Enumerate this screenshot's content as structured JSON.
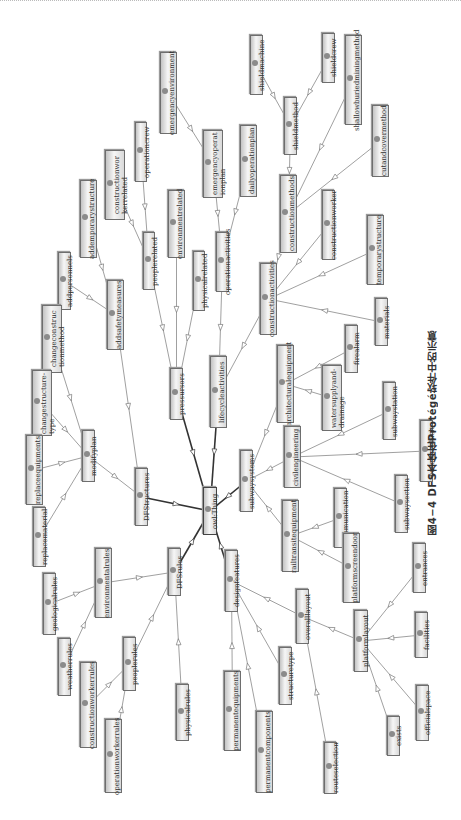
{
  "diagram": {
    "root": "owl:Thing",
    "orientation": "rotated-90",
    "node_style": {
      "fill": "#ececec",
      "border": "#6e6e6e",
      "dot": "#8b8b8b",
      "edge": "#777777",
      "edge_root": "#333333"
    },
    "nodes": [
      {
        "id": "thing",
        "label": "owl:Thing",
        "x": 203,
        "y": 487,
        "w": 14,
        "h": 48
      },
      {
        "id": "dfstructures",
        "label": "DFStructures",
        "x": 135,
        "y": 468,
        "w": 13,
        "h": 58
      },
      {
        "id": "dfsrules",
        "label": "DFSrules",
        "x": 168,
        "y": 548,
        "w": 13,
        "h": 48
      },
      {
        "id": "pressursors",
        "label": "pressursors",
        "x": 170,
        "y": 368,
        "w": 13,
        "h": 52
      },
      {
        "id": "lifecycleactivities",
        "label": "lifecycleactivities",
        "x": 210,
        "y": 356,
        "w": 17,
        "h": 72
      },
      {
        "id": "subwaysystems",
        "label": "subwaysystems",
        "x": 240,
        "y": 450,
        "w": 13,
        "h": 62
      },
      {
        "id": "designfeatures",
        "label": "designfeatures",
        "x": 225,
        "y": 550,
        "w": 13,
        "h": 62
      },
      {
        "id": "modifyplan",
        "label": "modifyplan",
        "x": 82,
        "y": 430,
        "w": 13,
        "h": 52
      },
      {
        "id": "addsafetymeasures",
        "label": "addsafetymeasures",
        "x": 107,
        "y": 280,
        "w": 17,
        "h": 70
      },
      {
        "id": "peoplerelated",
        "label": "peoplerelated",
        "x": 143,
        "y": 232,
        "w": 12,
        "h": 58
      },
      {
        "id": "environmentrelated",
        "label": "environmentrelated",
        "x": 168,
        "y": 190,
        "w": 17,
        "h": 68
      },
      {
        "id": "physicalrelated",
        "label": "physicalrelated",
        "x": 193,
        "y": 251,
        "w": 12,
        "h": 60
      },
      {
        "id": "operationactivities",
        "label": "operationactivities",
        "x": 216,
        "y": 232,
        "w": 13,
        "h": 60
      },
      {
        "id": "constructionactivities",
        "label": "constructionactivities",
        "x": 260,
        "y": 263,
        "w": 17,
        "h": 72
      },
      {
        "id": "architecturalequipment",
        "label": "architecturalequipment",
        "x": 277,
        "y": 345,
        "w": 17,
        "h": 78
      },
      {
        "id": "civilengineering",
        "label": "civilengineering",
        "x": 284,
        "y": 426,
        "w": 17,
        "h": 62
      },
      {
        "id": "railtransitequipment",
        "label": "railtransitequipment",
        "x": 282,
        "y": 500,
        "w": 17,
        "h": 72
      },
      {
        "id": "addemporarystructure",
        "label": "addemporarystructure",
        "x": 80,
        "y": 180,
        "w": 17,
        "h": 78
      },
      {
        "id": "constructionworkerrelated",
        "label": "constructionwor\nkerrelated",
        "x": 105,
        "y": 150,
        "w": 20,
        "h": 70
      },
      {
        "id": "operationcrew",
        "label": "operationcrew",
        "x": 135,
        "y": 122,
        "w": 12,
        "h": 60
      },
      {
        "id": "emergencyenvironment",
        "label": "emergencyenvironment",
        "x": 160,
        "y": 52,
        "w": 17,
        "h": 82
      },
      {
        "id": "emergencyoperationplan",
        "label": "emergencyoperat\nionplan",
        "x": 203,
        "y": 130,
        "w": 20,
        "h": 68
      },
      {
        "id": "dailyoperationplan",
        "label": "dailyoperationplan",
        "x": 240,
        "y": 125,
        "w": 17,
        "h": 72
      },
      {
        "id": "addpersonnels",
        "label": "addpersonnels",
        "x": 58,
        "y": 252,
        "w": 13,
        "h": 58
      },
      {
        "id": "changeconstructionmethod",
        "label": "changeconstruc\ntionmethod",
        "x": 42,
        "y": 305,
        "w": 20,
        "h": 68
      },
      {
        "id": "changestructuretype",
        "label": "changestructure-\ntype",
        "x": 32,
        "y": 370,
        "w": 20,
        "h": 66
      },
      {
        "id": "replaceequipments",
        "label": "replaceequipments",
        "x": 26,
        "y": 435,
        "w": 17,
        "h": 70
      },
      {
        "id": "replacematerial",
        "label": "replacematerial",
        "x": 33,
        "y": 507,
        "w": 13,
        "h": 60
      },
      {
        "id": "constructionmethods",
        "label": "constructionmethods",
        "x": 280,
        "y": 175,
        "w": 17,
        "h": 78
      },
      {
        "id": "constructionworker",
        "label": "constructionworker",
        "x": 322,
        "y": 190,
        "w": 13,
        "h": 70
      },
      {
        "id": "temporarystructure",
        "label": "temporarystructure",
        "x": 367,
        "y": 215,
        "w": 17,
        "h": 70
      },
      {
        "id": "materials",
        "label": "materials",
        "x": 375,
        "y": 298,
        "w": 13,
        "h": 48
      },
      {
        "id": "firealarm",
        "label": "firealarm",
        "x": 345,
        "y": 325,
        "w": 13,
        "h": 48
      },
      {
        "id": "watersupplyanddrainage",
        "label": "watersupplyand-\ndrainage",
        "x": 322,
        "y": 365,
        "w": 20,
        "h": 66
      },
      {
        "id": "subwaystation",
        "label": "subwaystation",
        "x": 383,
        "y": 382,
        "w": 13,
        "h": 58
      },
      {
        "id": "baseforvehicle",
        "label": "baseforvehicle",
        "x": 420,
        "y": 420,
        "w": 13,
        "h": 62
      },
      {
        "id": "subwaysection",
        "label": "subwaysection",
        "x": 395,
        "y": 475,
        "w": 13,
        "h": 58
      },
      {
        "id": "communication",
        "label": "communication",
        "x": 334,
        "y": 488,
        "w": 13,
        "h": 60
      },
      {
        "id": "platformscreendoor",
        "label": "platformscreendoor",
        "x": 343,
        "y": 533,
        "w": 17,
        "h": 70
      },
      {
        "id": "shieldmethod",
        "label": "shieldmethod",
        "x": 284,
        "y": 97,
        "w": 13,
        "h": 58
      },
      {
        "id": "shieldmachine",
        "label": "shieldmachine",
        "x": 250,
        "y": 35,
        "w": 13,
        "h": 60
      },
      {
        "id": "shieldcrew",
        "label": "shieldcrew",
        "x": 322,
        "y": 33,
        "w": 13,
        "h": 50
      },
      {
        "id": "shallowburiedminingmethod",
        "label": "shallowburiedminingmethod",
        "x": 345,
        "y": 35,
        "w": 17,
        "h": 90
      },
      {
        "id": "cutandcovermethod",
        "label": "cutandcovermethod",
        "x": 372,
        "y": 105,
        "w": 17,
        "h": 72
      },
      {
        "id": "environmentalrules",
        "label": "environmentalrules",
        "x": 95,
        "y": 548,
        "w": 17,
        "h": 70
      },
      {
        "id": "geologicalrules",
        "label": "geologicalrules",
        "x": 43,
        "y": 573,
        "w": 13,
        "h": 62
      },
      {
        "id": "weatherrules",
        "label": "weatherrules",
        "x": 58,
        "y": 638,
        "w": 13,
        "h": 58
      },
      {
        "id": "peoplerules",
        "label": "peoplerules",
        "x": 123,
        "y": 637,
        "w": 13,
        "h": 54
      },
      {
        "id": "constructionworkerrules",
        "label": "constructionworkerrules",
        "x": 80,
        "y": 662,
        "w": 17,
        "h": 86
      },
      {
        "id": "operationworkerrules",
        "label": "operationworkerrules",
        "x": 105,
        "y": 719,
        "w": 17,
        "h": 74
      },
      {
        "id": "physicalrules",
        "label": "physicalrules",
        "x": 176,
        "y": 684,
        "w": 13,
        "h": 57
      },
      {
        "id": "permanentequipments",
        "label": "permanentequipments",
        "x": 224,
        "y": 671,
        "w": 17,
        "h": 80
      },
      {
        "id": "permanentcomponents",
        "label": "permanentcomponents",
        "x": 256,
        "y": 711,
        "w": 17,
        "h": 82
      },
      {
        "id": "structuretype",
        "label": "structuretype",
        "x": 279,
        "y": 647,
        "w": 13,
        "h": 58
      },
      {
        "id": "overalllayout",
        "label": "overalllayout",
        "x": 296,
        "y": 589,
        "w": 13,
        "h": 55
      },
      {
        "id": "routeselection",
        "label": "routeselection",
        "x": 324,
        "y": 742,
        "w": 13,
        "h": 52
      },
      {
        "id": "platformlayout",
        "label": "platformlayout",
        "x": 354,
        "y": 610,
        "w": 14,
        "h": 62
      },
      {
        "id": "entrances",
        "label": "entrances",
        "x": 413,
        "y": 543,
        "w": 13,
        "h": 50
      },
      {
        "id": "facilities",
        "label": "facilities",
        "x": 415,
        "y": 612,
        "w": 13,
        "h": 46
      },
      {
        "id": "officialspace",
        "label": "officialspace",
        "x": 416,
        "y": 685,
        "w": 13,
        "h": 56
      },
      {
        "id": "exists",
        "label": "exists",
        "x": 387,
        "y": 716,
        "w": 13,
        "h": 40
      }
    ],
    "edges": [
      [
        "thing",
        "dfstructures"
      ],
      [
        "thing",
        "dfsrules"
      ],
      [
        "thing",
        "pressursors"
      ],
      [
        "thing",
        "lifecycleactivities"
      ],
      [
        "thing",
        "subwaysystems"
      ],
      [
        "thing",
        "designfeatures"
      ],
      [
        "dfstructures",
        "modifyplan"
      ],
      [
        "dfstructures",
        "addsafetymeasures"
      ],
      [
        "modifyplan",
        "changeconstructionmethod"
      ],
      [
        "modifyplan",
        "changestructuretype"
      ],
      [
        "modifyplan",
        "replaceequipments"
      ],
      [
        "modifyplan",
        "replacematerial"
      ],
      [
        "addsafetymeasures",
        "addpersonnels"
      ],
      [
        "addsafetymeasures",
        "addemporarystructure"
      ],
      [
        "pressursors",
        "peoplerelated"
      ],
      [
        "pressursors",
        "environmentrelated"
      ],
      [
        "pressursors",
        "physicalrelated"
      ],
      [
        "peoplerelated",
        "constructionworkerrelated"
      ],
      [
        "peoplerelated",
        "operationcrew"
      ],
      [
        "lifecycleactivities",
        "operationactivities"
      ],
      [
        "lifecycleactivities",
        "constructionactivities"
      ],
      [
        "operationactivities",
        "emergencyoperationplan"
      ],
      [
        "operationactivities",
        "dailyoperationplan"
      ],
      [
        "emergencyoperationplan",
        "emergencyenvironment"
      ],
      [
        "constructionactivities",
        "constructionmethods"
      ],
      [
        "constructionactivities",
        "constructionworker"
      ],
      [
        "constructionactivities",
        "temporarystructure"
      ],
      [
        "constructionactivities",
        "materials"
      ],
      [
        "constructionmethods",
        "shieldmethod"
      ],
      [
        "constructionmethods",
        "shallowburiedminingmethod"
      ],
      [
        "constructionmethods",
        "cutandcovermethod"
      ],
      [
        "shieldmethod",
        "shieldmachine"
      ],
      [
        "shieldmethod",
        "shieldcrew"
      ],
      [
        "subwaysystems",
        "architecturalequipment"
      ],
      [
        "subwaysystems",
        "civilengineering"
      ],
      [
        "subwaysystems",
        "railtransitequipment"
      ],
      [
        "architecturalequipment",
        "firealarm"
      ],
      [
        "architecturalequipment",
        "watersupplyanddrainage"
      ],
      [
        "civilengineering",
        "subwaystation"
      ],
      [
        "civilengineering",
        "baseforvehicle"
      ],
      [
        "civilengineering",
        "subwaysection"
      ],
      [
        "railtransitequipment",
        "communication"
      ],
      [
        "railtransitequipment",
        "platformscreendoor"
      ],
      [
        "dfsrules",
        "environmentalrules"
      ],
      [
        "dfsrules",
        "peoplerules"
      ],
      [
        "dfsrules",
        "physicalrules"
      ],
      [
        "environmentalrules",
        "geologicalrules"
      ],
      [
        "environmentalrules",
        "weatherrules"
      ],
      [
        "peoplerules",
        "constructionworkerrules"
      ],
      [
        "peoplerules",
        "operationworkerrules"
      ],
      [
        "designfeatures",
        "permanentequipments"
      ],
      [
        "designfeatures",
        "permanentcomponents"
      ],
      [
        "designfeatures",
        "structuretype"
      ],
      [
        "designfeatures",
        "overalllayout"
      ],
      [
        "overalllayout",
        "platformlayout"
      ],
      [
        "overalllayout",
        "routeselection"
      ],
      [
        "platformlayout",
        "entrances"
      ],
      [
        "platformlayout",
        "facilities"
      ],
      [
        "platformlayout",
        "officialspace"
      ],
      [
        "platformlayout",
        "exists"
      ]
    ]
  },
  "caption": "图4−4   DFS本体在Protégé软件中的示意"
}
